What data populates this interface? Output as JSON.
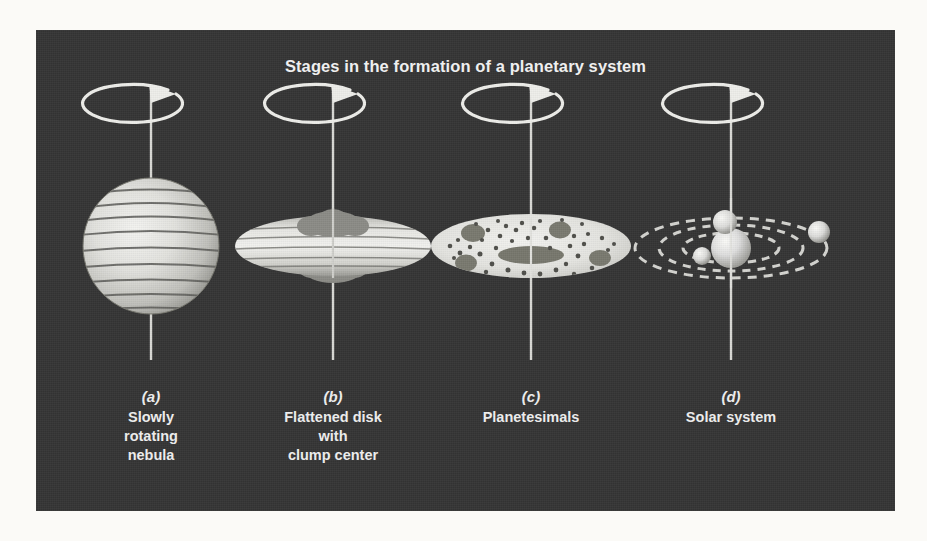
{
  "figure": {
    "title": "Stages in the formation of a planetary system",
    "background_color": "#343434",
    "page_color": "#fbfaf7",
    "text_color": "#efefef"
  },
  "panels": [
    {
      "id": "a",
      "letter": "(a)",
      "caption_lines": [
        "Slowly",
        "rotating",
        "nebula"
      ],
      "icon": "rotating-sphere-nebula",
      "rotation_arrow": true,
      "axis": true
    },
    {
      "id": "b",
      "letter": "(b)",
      "caption_lines": [
        "Flattened disk",
        "with",
        "clump center"
      ],
      "icon": "flattened-disk-with-clump",
      "rotation_arrow": true,
      "axis": true
    },
    {
      "id": "c",
      "letter": "(c)",
      "caption_lines": [
        "Planetesimals"
      ],
      "icon": "planetesimal-disk",
      "rotation_arrow": true,
      "axis": true
    },
    {
      "id": "d",
      "letter": "(d)",
      "caption_lines": [
        "Solar system"
      ],
      "icon": "solar-system-orbits",
      "rotation_arrow": true,
      "axis": true
    }
  ],
  "colors": {
    "nebula_light": "#e9e9e6",
    "nebula_mid": "#c2c2bd",
    "nebula_band": "#5e5e5a",
    "clump_gray": "#8e8e8a",
    "disk_light": "#e3e3df",
    "dot_dark": "#555551",
    "orbit_dash": "#d8d8d4",
    "axis_line": "#d9d9d5",
    "planet_light": "#dedede"
  }
}
